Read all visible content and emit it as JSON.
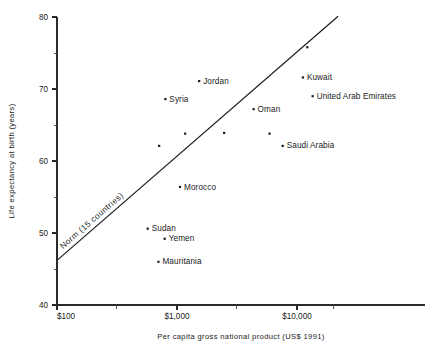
{
  "chart_data": {
    "type": "scatter",
    "title": "",
    "xlabel": "Per capita gross national product (US$ 1991)",
    "ylabel": "Life expectancy at birth (years)",
    "xscale": "log",
    "xlim": [
      100,
      25000
    ],
    "ylim": [
      40,
      80
    ],
    "grid": false,
    "legend": "none",
    "xticks": [
      {
        "value": 100,
        "label": "$100",
        "type": "major"
      },
      {
        "value": 1000,
        "label": "$1,000",
        "type": "major"
      },
      {
        "value": 10000,
        "label": "$10,000",
        "type": "major"
      },
      {
        "value": 316,
        "label": "",
        "type": "minor"
      },
      {
        "value": 3162,
        "label": "",
        "type": "minor"
      },
      {
        "value": 20000,
        "label": "",
        "type": "minor"
      }
    ],
    "yticks": [
      {
        "value": 40,
        "label": "40",
        "type": "major"
      },
      {
        "value": 45,
        "label": "",
        "type": "minor"
      },
      {
        "value": 50,
        "label": "50",
        "type": "major"
      },
      {
        "value": 55,
        "label": "",
        "type": "minor"
      },
      {
        "value": 60,
        "label": "60",
        "type": "major"
      },
      {
        "value": 65,
        "label": "",
        "type": "minor"
      },
      {
        "value": 70,
        "label": "70",
        "type": "major"
      },
      {
        "value": 75,
        "label": "",
        "type": "minor"
      },
      {
        "value": 80,
        "label": "80",
        "type": "major"
      }
    ],
    "points": [
      {
        "label": "Kuwait",
        "x": 11200,
        "y": 71.6,
        "label_dx": 4,
        "label_dy": 2.6
      },
      {
        "label": "United Arab Emirates",
        "x": 13500,
        "y": 69.0,
        "label_dx": 4,
        "label_dy": 2.6
      },
      {
        "label": "Jordan",
        "x": 1530,
        "y": 71.1,
        "label_dx": 4,
        "label_dy": 2.6
      },
      {
        "label": "Syria",
        "x": 800,
        "y": 68.6,
        "label_dx": 4,
        "label_dy": 2.6
      },
      {
        "label": "Oman",
        "x": 4350,
        "y": 67.2,
        "label_dx": 4,
        "label_dy": 2.6
      },
      {
        "label": "Saudi Arabia",
        "x": 7600,
        "y": 62.1,
        "label_dx": 4,
        "label_dy": 2.6
      },
      {
        "label": "Morocco",
        "x": 1060,
        "y": 56.4,
        "label_dx": 4,
        "label_dy": 2.6
      },
      {
        "label": "Sudan",
        "x": 570,
        "y": 50.6,
        "label_dx": 4,
        "label_dy": 2.6
      },
      {
        "label": "Yemen",
        "x": 790,
        "y": 49.2,
        "label_dx": 4,
        "label_dy": 2.6
      },
      {
        "label": "Mauritania",
        "x": 700,
        "y": 46.0,
        "label_dx": 4,
        "label_dy": 2.6
      },
      {
        "label": "",
        "x": 12200,
        "y": 75.8,
        "label_dx": 0,
        "label_dy": 0
      },
      {
        "label": "",
        "x": 2470,
        "y": 63.9,
        "label_dx": 0,
        "label_dy": 0
      },
      {
        "label": "",
        "x": 1170,
        "y": 63.8,
        "label_dx": 0,
        "label_dy": 0
      },
      {
        "label": "",
        "x": 710,
        "y": 62.1,
        "label_dx": 0,
        "label_dy": 0
      },
      {
        "label": "",
        "x": 5900,
        "y": 63.8,
        "label_dx": 0,
        "label_dy": 0
      }
    ],
    "trendline": {
      "label": "Norm  (15 countries)",
      "x0": 100,
      "y0": 46.2,
      "x1": 22000,
      "y1": 80.1
    }
  }
}
